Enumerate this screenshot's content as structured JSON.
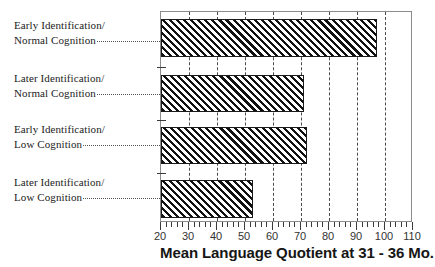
{
  "chart_data": {
    "type": "bar",
    "orientation": "horizontal",
    "title": "",
    "subtitle": "",
    "xlabel": "Mean Language Quotient at 31 - 36  Mo.",
    "ylabel": "",
    "xlim": [
      20,
      110
    ],
    "xticks": [
      20,
      30,
      40,
      50,
      60,
      70,
      80,
      90,
      100,
      110
    ],
    "xtick_labels": [
      "20",
      "30",
      "40",
      "50",
      "60",
      "70",
      "80",
      "90",
      "100",
      "110"
    ],
    "minor_tick_step": 2,
    "grid": {
      "vertical": true,
      "horizontal": false,
      "style": "dashed",
      "at": [
        30,
        40,
        50,
        60,
        70,
        80,
        90,
        100
      ]
    },
    "legend": {
      "visible": false,
      "position": "none"
    },
    "bar_style": {
      "fill": "diagonal-hatch",
      "hatch_color": "#111111",
      "background": "#ffffff",
      "edge_color": "#1a1a1a"
    },
    "categories": [
      "Early Identification/ Normal Cognition",
      "Later Identification/ Normal  Cognition",
      "Early Identification/ Low Cognition",
      "Later Identification/ Low Cognition"
    ],
    "values": [
      97,
      71,
      72,
      53
    ]
  },
  "labels": [
    {
      "line1": "Early Identification/",
      "line2": "Normal Cognition",
      "leader": true
    },
    {
      "line1": "Later Identification/",
      "line2": "Normal  Cognition",
      "leader": true
    },
    {
      "line1": "Early Identification/",
      "line2": "Low Cognition",
      "leader": true
    },
    {
      "line1": "Later Identification/",
      "line2": "Low Cognition",
      "leader": true
    }
  ],
  "axis": {
    "title": "Mean Language Quotient at 31 - 36  Mo.",
    "tick_labels": [
      "20",
      "30",
      "40",
      "50",
      "60",
      "70",
      "80",
      "90",
      "100",
      "110"
    ]
  }
}
